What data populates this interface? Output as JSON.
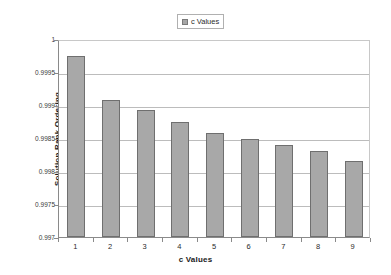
{
  "legend": {
    "swatch_name": "series-color-swatch",
    "swatch_color": "#a6a6a6",
    "entries": [
      "c Values"
    ]
  },
  "axes": {
    "y_title": "Solution Rank Ordering",
    "x_title": "c Values",
    "y_tick_labels": [
      "1",
      "0.9995",
      "0.999",
      "0.9985",
      "0.998",
      "0.9975",
      "0.997"
    ],
    "x_tick_labels": [
      "1",
      "2",
      "3",
      "4",
      "5",
      "6",
      "7",
      "8",
      "9"
    ]
  },
  "chart_data": {
    "type": "bar",
    "title": "",
    "subtitle": "",
    "xlabel": "c Values",
    "ylabel": "Solution Rank Ordering",
    "categories": [
      "1",
      "2",
      "3",
      "4",
      "5",
      "6",
      "7",
      "8",
      "9"
    ],
    "series": [
      {
        "name": "c Values",
        "color": "#a8a8a8",
        "values": [
          0.99975,
          0.99908,
          0.99892,
          0.99875,
          0.99858,
          0.99849,
          0.9984,
          0.99831,
          0.99815
        ]
      }
    ],
    "ylim": [
      0.997,
      1
    ],
    "ytick_values": [
      1,
      0.9995,
      0.999,
      0.9985,
      0.998,
      0.9975,
      0.997
    ],
    "ytick_labels": [
      "1",
      "0.9995",
      "0.999",
      "0.9985",
      "0.998",
      "0.9975",
      "0.997"
    ],
    "grid": true,
    "grid_axis": "y",
    "legend_position": "top-center"
  }
}
